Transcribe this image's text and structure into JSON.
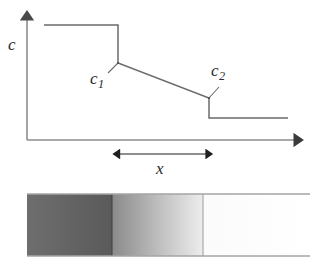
{
  "figure": {
    "background_color": "#ffffff",
    "line_color": "#4a4a4a",
    "text_color": "#2b2b2b"
  },
  "plot": {
    "axes": {
      "y_label": "c",
      "y_axis_name": "concentration-axis",
      "x_axis_name": "distance-axis",
      "origin": {
        "x": 27,
        "y": 140
      },
      "y_arrow_tip": {
        "x": 27,
        "y": 13
      },
      "x_arrow_tip": {
        "x": 303,
        "y": 140
      }
    },
    "curve": {
      "name": "concentration-profile",
      "points": [
        {
          "x": 44,
          "y": 25
        },
        {
          "x": 118,
          "y": 25
        },
        {
          "x": 118,
          "y": 63
        },
        {
          "x": 209,
          "y": 98
        },
        {
          "x": 209,
          "y": 118
        },
        {
          "x": 288,
          "y": 118
        }
      ]
    },
    "annotations": [
      {
        "name": "c1-annotation",
        "base": "c",
        "sub": "1",
        "marker": {
          "x": 118,
          "y": 63
        },
        "leader_end": {
          "x": 109,
          "y": 72
        }
      },
      {
        "name": "c2-annotation",
        "base": "c",
        "sub": "2",
        "marker": {
          "x": 209,
          "y": 98
        },
        "leader_end": {
          "x": 218,
          "y": 88
        }
      }
    ],
    "span_arrow": {
      "name": "layer-thickness-arrow",
      "label": "x",
      "y": 154,
      "x_start": 118,
      "x_end": 209
    }
  },
  "gradient_bar": {
    "name": "diffusion-couple-bar",
    "bounds": {
      "x": 27,
      "y": 194,
      "width": 283,
      "height": 62
    },
    "zones": [
      {
        "name": "left-phase-zone",
        "x_start": 27,
        "x_end": 112,
        "fill_start": "#6e6e6e",
        "fill_end": "#5a5a5a",
        "description": "dark uniform terminal phase"
      },
      {
        "name": "intermediate-phase-zone",
        "x_start": 112,
        "x_end": 203,
        "fill_start": "#8a8a8a",
        "fill_end": "#ededed",
        "description": "graded intermediate layer"
      },
      {
        "name": "right-phase-zone",
        "x_start": 203,
        "x_end": 310,
        "fill_start": "#fbfbfb",
        "fill_end": "#ffffff",
        "description": "light uniform terminal phase"
      }
    ],
    "boundaries": [
      {
        "name": "left-interface-line",
        "x": 112
      },
      {
        "name": "right-interface-line",
        "x": 203
      }
    ]
  }
}
